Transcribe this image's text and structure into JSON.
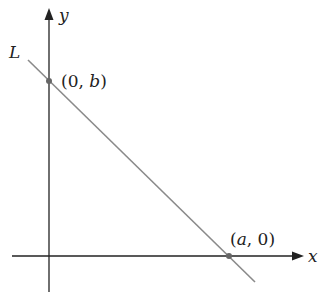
{
  "diagram": {
    "title": "",
    "axes": {
      "x_label": "x",
      "y_label": "y"
    },
    "line": {
      "label": "L",
      "color": "#8a8a8a"
    },
    "points": [
      {
        "label_open": "(0, ",
        "label_var": "b",
        "label_close": ")"
      },
      {
        "label_open": "(",
        "label_var": "a",
        "label_close": ", 0)"
      }
    ],
    "colors": {
      "axis": "#222222",
      "point": "#666666"
    }
  }
}
